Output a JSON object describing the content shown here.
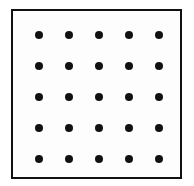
{
  "figure": {
    "canvas": {
      "width": 194,
      "height": 186,
      "background_color": "#ffffff"
    },
    "frame": {
      "name": "square-border",
      "left": 11,
      "top": 9,
      "width": 171,
      "height": 170,
      "border_width": 2.5,
      "border_color": "#111111",
      "fill_color": "#fdfdfd"
    },
    "grid": {
      "rows": 5,
      "columns": 5,
      "dot_count": 25,
      "dot_diameter": 8,
      "dot_color": "#111111",
      "column_centers_x": [
        37,
        67,
        97,
        127,
        157
      ],
      "row_centers_y": [
        33,
        64,
        95,
        126,
        157
      ],
      "column_spacing": 30,
      "row_spacing": 31
    }
  },
  "chart_data": {
    "type": "scatter",
    "title": "",
    "xlabel": "",
    "ylabel": "",
    "grid": false,
    "legend": "none",
    "xlim": [
      0,
      6
    ],
    "ylim": [
      0,
      6
    ],
    "x": [
      1,
      2,
      3,
      4,
      5,
      1,
      2,
      3,
      4,
      5,
      1,
      2,
      3,
      4,
      5,
      1,
      2,
      3,
      4,
      5,
      1,
      2,
      3,
      4,
      5
    ],
    "y": [
      5,
      5,
      5,
      5,
      5,
      4,
      4,
      4,
      4,
      4,
      3,
      3,
      3,
      3,
      3,
      2,
      2,
      2,
      2,
      2,
      1,
      1,
      1,
      1,
      1
    ],
    "marker": "circle",
    "marker_color": "#111111",
    "marker_size": 8
  }
}
